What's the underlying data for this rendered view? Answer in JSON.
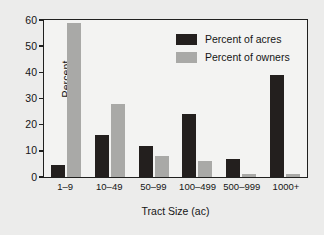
{
  "chart_data": {
    "type": "bar",
    "title": "",
    "xlabel": "Tract Size (ac)",
    "ylabel": "Percent",
    "ylim": [
      0,
      60
    ],
    "yticks": [
      0,
      10,
      20,
      30,
      40,
      50,
      60
    ],
    "grid": false,
    "legend_position": "upper right",
    "categories": [
      "1–9",
      "10–49",
      "50–99",
      "100–499",
      "500–999",
      "1000+"
    ],
    "series": [
      {
        "name": "Percent of acres",
        "color": "#231f1e",
        "values": [
          4.5,
          16,
          12,
          24,
          7,
          39
        ]
      },
      {
        "name": "Percent of owners",
        "color": "#a9a9a7",
        "values": [
          59,
          28,
          8,
          6,
          1,
          1
        ]
      }
    ]
  }
}
